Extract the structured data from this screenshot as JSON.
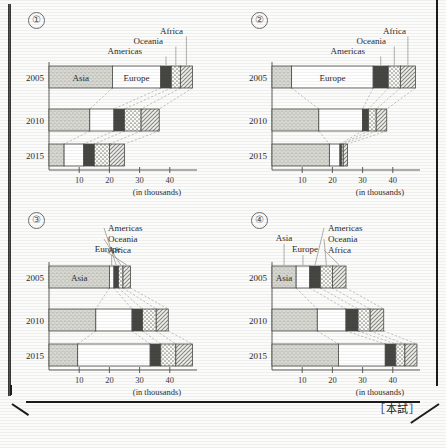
{
  "page": {
    "caption": "［本試］",
    "axis_unit_label": "(in thousands)",
    "tick_labels": [
      "10",
      "20",
      "30",
      "40"
    ],
    "tick_values": [
      10,
      20,
      30,
      40
    ],
    "years": [
      "2005",
      "2010",
      "2015"
    ],
    "region_labels": [
      "Asia",
      "Europe",
      "Americas",
      "Oceania",
      "Africa"
    ]
  },
  "options": [
    {
      "number": "①"
    },
    {
      "number": "②"
    },
    {
      "number": "③"
    },
    {
      "number": "④"
    }
  ],
  "chart_data": [
    {
      "type": "bar",
      "id": "option-1",
      "title": "①",
      "orientation": "horizontal",
      "stacked": true,
      "xlabel": "(in thousands)",
      "ylabel": "",
      "xlim": [
        0,
        50
      ],
      "xticks": [
        10,
        20,
        30,
        40
      ],
      "grid": false,
      "legend": "callout-labels-top-right",
      "categories": [
        "2005",
        "2010",
        "2015"
      ],
      "series": [
        {
          "name": "Asia",
          "values": [
            21.0,
            13.5,
            5.0
          ]
        },
        {
          "name": "Europe",
          "values": [
            16.0,
            8.0,
            6.5
          ]
        },
        {
          "name": "Americas",
          "values": [
            3.5,
            3.5,
            3.5
          ]
        },
        {
          "name": "Oceania",
          "values": [
            3.0,
            5.5,
            5.0
          ]
        },
        {
          "name": "Africa",
          "values": [
            4.0,
            6.0,
            5.0
          ]
        }
      ],
      "totals": [
        47.5,
        36.5,
        25.0
      ],
      "inline_labels": {
        "2005": [
          "Asia",
          "Europe"
        ]
      }
    },
    {
      "type": "bar",
      "id": "option-2",
      "title": "②",
      "orientation": "horizontal",
      "stacked": true,
      "xlabel": "(in thousands)",
      "ylabel": "",
      "xlim": [
        0,
        50
      ],
      "xticks": [
        10,
        20,
        30,
        40
      ],
      "grid": false,
      "legend": "callout-labels-top-right",
      "categories": [
        "2005",
        "2010",
        "2015"
      ],
      "series": [
        {
          "name": "Asia",
          "values": [
            6.5,
            15.5,
            19.0
          ]
        },
        {
          "name": "Europe",
          "values": [
            27.0,
            14.5,
            3.5
          ]
        },
        {
          "name": "Americas",
          "values": [
            5.0,
            2.0,
            0.6
          ]
        },
        {
          "name": "Oceania",
          "values": [
            4.0,
            2.5,
            0.5
          ]
        },
        {
          "name": "Africa",
          "values": [
            5.0,
            3.5,
            1.4
          ]
        }
      ],
      "totals": [
        47.5,
        38.0,
        25.0
      ],
      "inline_labels": {
        "2005": [
          "Asia",
          "Europe"
        ]
      }
    },
    {
      "type": "bar",
      "id": "option-3",
      "title": "③",
      "orientation": "horizontal",
      "stacked": true,
      "xlabel": "(in thousands)",
      "ylabel": "",
      "xlim": [
        0,
        50
      ],
      "xticks": [
        10,
        20,
        30,
        40
      ],
      "grid": false,
      "legend": "callout-labels-top",
      "categories": [
        "2005",
        "2010",
        "2015"
      ],
      "series": [
        {
          "name": "Asia",
          "values": [
            20.0,
            15.5,
            9.5
          ]
        },
        {
          "name": "Europe",
          "values": [
            1.5,
            12.0,
            24.0
          ]
        },
        {
          "name": "Americas",
          "values": [
            1.5,
            3.5,
            3.5
          ]
        },
        {
          "name": "Oceania",
          "values": [
            1.5,
            4.5,
            5.0
          ]
        },
        {
          "name": "Africa",
          "values": [
            2.5,
            4.0,
            5.5
          ]
        }
      ],
      "totals": [
        27.0,
        39.5,
        47.5
      ],
      "inline_labels": {
        "2005": [
          "Asia"
        ]
      }
    },
    {
      "type": "bar",
      "id": "option-4",
      "title": "④",
      "orientation": "horizontal",
      "stacked": true,
      "xlabel": "(in thousands)",
      "ylabel": "",
      "xlim": [
        0,
        50
      ],
      "xticks": [
        10,
        20,
        30,
        40
      ],
      "grid": false,
      "legend": "callout-labels-top",
      "categories": [
        "2005",
        "2010",
        "2015"
      ],
      "series": [
        {
          "name": "Asia",
          "values": [
            8.0,
            15.0,
            22.0
          ]
        },
        {
          "name": "Europe",
          "values": [
            4.5,
            9.5,
            15.5
          ]
        },
        {
          "name": "Americas",
          "values": [
            3.5,
            4.0,
            3.5
          ]
        },
        {
          "name": "Oceania",
          "values": [
            4.0,
            4.0,
            3.0
          ]
        },
        {
          "name": "Africa",
          "values": [
            4.5,
            4.5,
            4.0
          ]
        }
      ],
      "totals": [
        24.5,
        37.0,
        48.0
      ],
      "inline_labels": {
        "2005": [
          "Asia",
          "Europe"
        ]
      }
    }
  ]
}
